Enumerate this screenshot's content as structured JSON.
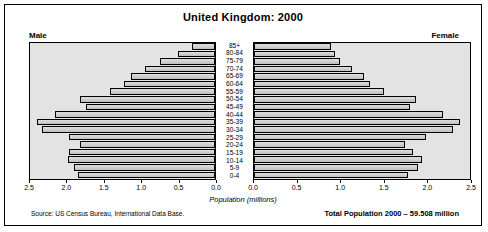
{
  "title": "United Kingdom: 2000",
  "labels": {
    "male": "Male",
    "female": "Female",
    "axis_title": "Population (millions)",
    "source": "Source: US Census Bureau, International Data Base.",
    "total": "Total Population 2000 – 59.508 million"
  },
  "chart_data": {
    "type": "bar",
    "subtype": "population-pyramid",
    "title": "United Kingdom: 2000",
    "xlabel": "Population (millions)",
    "ylabel": "",
    "categories": [
      "85+",
      "80-84",
      "75-79",
      "70-74",
      "65-69",
      "60-64",
      "55-59",
      "50-54",
      "45-49",
      "40-44",
      "35-39",
      "30-34",
      "25-29",
      "20-24",
      "15-19",
      "10-14",
      "5-9",
      "0-4"
    ],
    "series": [
      {
        "name": "Male",
        "direction": "left",
        "xlim": [
          0,
          2.5
        ],
        "ticks": [
          2.5,
          2.0,
          1.5,
          1.0,
          0.5,
          0.0
        ],
        "values": [
          0.31,
          0.5,
          0.75,
          0.94,
          1.14,
          1.23,
          1.42,
          1.82,
          1.74,
          2.16,
          2.41,
          2.34,
          1.97,
          1.82,
          1.97,
          1.99,
          1.9,
          1.85
        ]
      },
      {
        "name": "Female",
        "direction": "right",
        "xlim": [
          0,
          2.5
        ],
        "ticks": [
          0.0,
          0.5,
          1.0,
          1.5,
          2.0,
          2.5
        ],
        "values": [
          0.89,
          0.94,
          1.0,
          1.14,
          1.27,
          1.34,
          1.51,
          1.88,
          1.8,
          2.19,
          2.39,
          2.3,
          1.99,
          1.75,
          1.84,
          1.94,
          1.9,
          1.78
        ]
      }
    ],
    "total_population_millions": 59.508,
    "grid": false,
    "legend": "side-labels"
  }
}
